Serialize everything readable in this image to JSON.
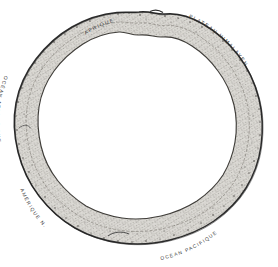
{
  "figure": {
    "kind": "hand-drawn-annular-diagram",
    "caption": "Coupe annulaire schématique",
    "background_color": "#ffffff",
    "ink_color": "#3b3b3b",
    "band_fill_color": "#d8d6d1",
    "band_outline_color": "#2b2b2b",
    "band_inner_line_color": "#4a4a4a",
    "stipple_color": "#5a5752"
  },
  "labels": [
    {
      "id": "afrique",
      "text": "AFRIQUE",
      "position": "top-left",
      "orientation": "along-arc"
    },
    {
      "id": "plateau-himalayen",
      "text": "PLATEAU HIMALAYEN",
      "position": "top-right",
      "orientation": "along-arc"
    },
    {
      "id": "ocean-atlantique",
      "text": "OCÉAN ATLANTIQUE",
      "position": "left",
      "orientation": "along-arc"
    },
    {
      "id": "amerique-n",
      "text": "AMÉRIQUE N.",
      "position": "bottom-left",
      "orientation": "along-arc"
    },
    {
      "id": "ocean-pacifique",
      "text": "OCÉAN PACIFIQUE",
      "position": "bottom-right",
      "orientation": "along-arc"
    }
  ]
}
